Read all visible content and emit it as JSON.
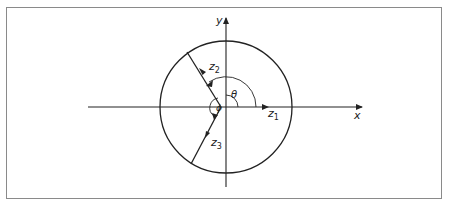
{
  "diagram": {
    "type": "polar-coordinate diagram",
    "axes": {
      "x_label": "x",
      "y_label": "y"
    },
    "vectors": {
      "z1": {
        "label": "z",
        "subscript": "1"
      },
      "z2": {
        "label": "z",
        "subscript": "2"
      },
      "z3": {
        "label": "z",
        "subscript": "3"
      }
    },
    "angles": {
      "theta": "θ",
      "phi": "ϕ"
    },
    "colors": {
      "line": "#222222",
      "frame": "#8a8a8a",
      "background": "#ffffff"
    }
  }
}
